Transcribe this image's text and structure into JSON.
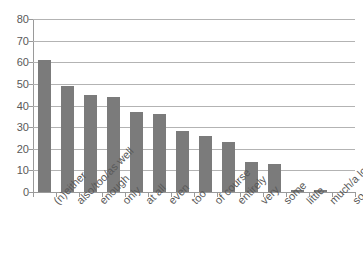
{
  "chart_data": {
    "type": "bar",
    "title": "",
    "subtitle": "",
    "xlabel": "",
    "ylabel": "",
    "ylim": [
      0,
      80
    ],
    "ytick_values": [
      0,
      10,
      20,
      30,
      40,
      50,
      60,
      70,
      80
    ],
    "ytick_labels": [
      "0",
      "10",
      "20",
      "30",
      "40",
      "50",
      "60",
      "70",
      "80"
    ],
    "grid": true,
    "legend": false,
    "legend_position": "none",
    "bar_color": "#7b7b7b",
    "gridline_color": "#b3b3b3",
    "axis_color": "#9a9a9a",
    "text_color": "#595959",
    "background": "#ffffff",
    "categories": [
      "(n)either",
      "also/too/as well",
      "enough",
      "only",
      "at all",
      "even",
      "too",
      "of course",
      "entirely",
      "very",
      "some",
      "little",
      "much/a lot",
      "so"
    ],
    "values": [
      61,
      49,
      45,
      44,
      37,
      36,
      28,
      26,
      23,
      14,
      13,
      1,
      1,
      0
    ]
  }
}
